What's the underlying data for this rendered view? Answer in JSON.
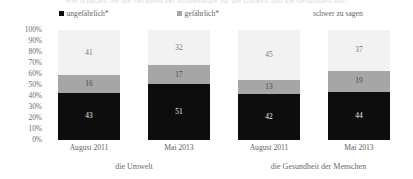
{
  "title_remnant": "Wie schätzen Sie die Gefahren der Atomenergie für die Umwelt und die Gesundheit ein?",
  "legend": {
    "items": [
      {
        "label": "ungefährlich*",
        "color": "#0d0d0d",
        "swatch": "legend-swatch-black"
      },
      {
        "label": "gefährlich*",
        "color": "#a6a6a6",
        "swatch": "legend-swatch-gray"
      },
      {
        "label": "schwer zu sagen",
        "color": "#f2f2f2",
        "swatch": "legend-swatch-light"
      }
    ]
  },
  "chart_data": {
    "type": "bar",
    "title": "",
    "xlabel": "",
    "ylabel": "",
    "ylim": [
      0,
      100
    ],
    "grid": false,
    "stacked": true,
    "percent": true,
    "legend_position": "top",
    "yticks": [
      "100%",
      "90%",
      "80%",
      "70%",
      "60%",
      "50%",
      "40%",
      "30%",
      "20%",
      "10%",
      "0%"
    ],
    "ytick_values": [
      100,
      90,
      80,
      70,
      60,
      50,
      40,
      30,
      20,
      10,
      0
    ],
    "categories": [
      "August 2011",
      "Mai 2013",
      "August 2011",
      "Mai 2013"
    ],
    "groups": [
      {
        "label": "die Umwelt",
        "categories": [
          "August 2011",
          "Mai 2013"
        ]
      },
      {
        "label": "die Gesundheit der Menschen",
        "categories": [
          "August 2011",
          "Mai 2013"
        ]
      }
    ],
    "series": [
      {
        "name": "ungefährlich*",
        "color": "#0d0d0d",
        "values": [
          43,
          51,
          42,
          44
        ]
      },
      {
        "name": "gefährlich*",
        "color": "#a6a6a6",
        "values": [
          16,
          17,
          13,
          19
        ]
      },
      {
        "name": "schwer zu sagen",
        "color": "#f2f2f2",
        "values": [
          41,
          32,
          45,
          37
        ]
      }
    ],
    "bars": [
      {
        "category": "August 2011",
        "group": "die Umwelt",
        "segments": [
          {
            "name": "ungefährlich*",
            "value": 43,
            "color": "#0d0d0d"
          },
          {
            "name": "gefährlich*",
            "value": 16,
            "color": "#a6a6a6"
          },
          {
            "name": "schwer zu sagen",
            "value": 41,
            "color": "#f2f2f2"
          }
        ]
      },
      {
        "category": "Mai 2013",
        "group": "die Umwelt",
        "segments": [
          {
            "name": "ungefährlich*",
            "value": 51,
            "color": "#0d0d0d"
          },
          {
            "name": "gefährlich*",
            "value": 17,
            "color": "#a6a6a6"
          },
          {
            "name": "schwer zu sagen",
            "value": 32,
            "color": "#f2f2f2"
          }
        ]
      },
      {
        "category": "August 2011",
        "group": "die Gesundheit der Menschen",
        "segments": [
          {
            "name": "ungefährlich*",
            "value": 42,
            "color": "#0d0d0d"
          },
          {
            "name": "gefährlich*",
            "value": 13,
            "color": "#a6a6a6"
          },
          {
            "name": "schwer zu sagen",
            "value": 45,
            "color": "#f2f2f2"
          }
        ]
      },
      {
        "category": "Mai 2013",
        "group": "die Gesundheit der Menschen",
        "segments": [
          {
            "name": "ungefährlich*",
            "value": 44,
            "color": "#0d0d0d"
          },
          {
            "name": "gefährlich*",
            "value": 19,
            "color": "#a6a6a6"
          },
          {
            "name": "schwer zu sagen",
            "value": 37,
            "color": "#f2f2f2"
          }
        ]
      }
    ]
  }
}
